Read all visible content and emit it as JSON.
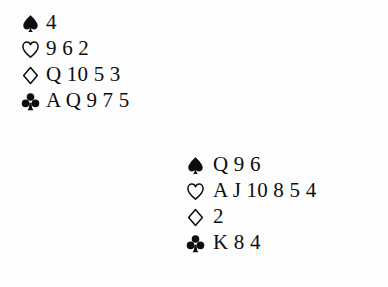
{
  "diagram": {
    "kind": "bridge-hand-diagram",
    "ink_color": "#0d0d0d",
    "background_color": "#fdfdfd",
    "suit_symbols": {
      "spade": "spade-icon",
      "heart": "heart-icon",
      "diamond": "diamond-icon",
      "club": "club-icon"
    }
  },
  "hands": [
    {
      "position": "north",
      "suits": [
        {
          "suit": "spades",
          "icon": "spade-icon",
          "filled": true,
          "ranks": "4"
        },
        {
          "suit": "hearts",
          "icon": "heart-icon",
          "filled": false,
          "ranks": "9 6 2"
        },
        {
          "suit": "diamonds",
          "icon": "diamond-icon",
          "filled": false,
          "ranks": "Q 10 5 3"
        },
        {
          "suit": "clubs",
          "icon": "club-icon",
          "filled": true,
          "ranks": "A Q 9 7 5"
        }
      ]
    },
    {
      "position": "south",
      "suits": [
        {
          "suit": "spades",
          "icon": "spade-icon",
          "filled": true,
          "ranks": "Q 9 6"
        },
        {
          "suit": "hearts",
          "icon": "heart-icon",
          "filled": false,
          "ranks": "A J 10 8 5 4"
        },
        {
          "suit": "diamonds",
          "icon": "diamond-icon",
          "filled": false,
          "ranks": "2"
        },
        {
          "suit": "clubs",
          "icon": "club-icon",
          "filled": true,
          "ranks": "K 8 4"
        }
      ]
    }
  ]
}
